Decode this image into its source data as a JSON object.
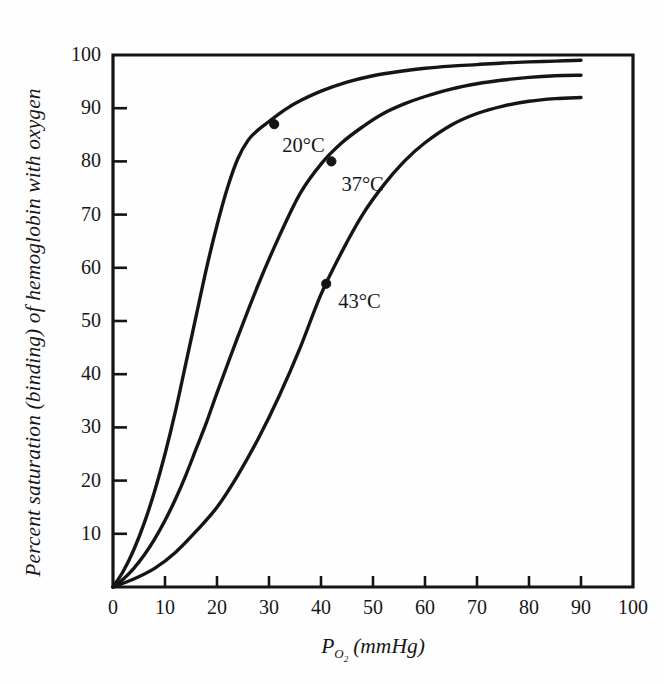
{
  "chart_data": {
    "type": "line",
    "title": "",
    "xlabel": "P_O2 (mmHg)",
    "xlabel_main": "P",
    "xlabel_sub": "O",
    "xlabel_sub2": "2",
    "xlabel_unit": "(mmHg)",
    "ylabel": "Percent saturation (binding) of hemoglobin with oxygen",
    "xlim": [
      0,
      100
    ],
    "ylim": [
      0,
      100
    ],
    "xticks": [
      0,
      10,
      20,
      30,
      40,
      50,
      60,
      70,
      80,
      90,
      100
    ],
    "yticks": [
      10,
      20,
      30,
      40,
      50,
      60,
      70,
      80,
      90,
      100
    ],
    "xtick_labels": [
      "0",
      "10",
      "20",
      "30",
      "40",
      "50",
      "60",
      "70",
      "80",
      "90",
      "100"
    ],
    "ytick_labels": [
      "10",
      "20",
      "30",
      "40",
      "50",
      "60",
      "70",
      "80",
      "90",
      "100"
    ],
    "grid": false,
    "legend_position": "inline-annotations",
    "line_color": "#151515",
    "background_color": "#fefefe",
    "axis_color": "#151515",
    "series": [
      {
        "name": "20°C",
        "label": "20°C",
        "marker_point": {
          "x": 31,
          "y": 87
        },
        "x": [
          0,
          2,
          4,
          6,
          8,
          10,
          12,
          14,
          16,
          18,
          20,
          22,
          24,
          26,
          28,
          30,
          32,
          34,
          36,
          40,
          45,
          50,
          55,
          60,
          65,
          70,
          75,
          80,
          85,
          90
        ],
        "y": [
          0,
          3,
          7,
          12,
          18,
          25,
          33,
          42,
          51,
          60,
          68,
          75,
          80.5,
          84,
          86,
          87.5,
          89,
          90.3,
          91.4,
          93.2,
          94.9,
          96.1,
          96.9,
          97.5,
          97.9,
          98.2,
          98.5,
          98.7,
          98.85,
          99
        ]
      },
      {
        "name": "37°C",
        "label": "37°C",
        "marker_point": {
          "x": 42,
          "y": 80
        },
        "x": [
          0,
          2,
          4,
          6,
          8,
          10,
          12,
          14,
          16,
          18,
          20,
          24,
          28,
          32,
          36,
          40,
          44,
          48,
          52,
          56,
          60,
          65,
          70,
          75,
          80,
          85,
          90
        ],
        "y": [
          0,
          1.5,
          3.5,
          6,
          9,
          12.5,
          16.5,
          21,
          26,
          31,
          36.5,
          47,
          57,
          66,
          74,
          79.5,
          83.5,
          86.5,
          89,
          90.8,
          92.2,
          93.6,
          94.6,
          95.3,
          95.8,
          96.1,
          96.2
        ]
      },
      {
        "name": "43°C",
        "label": "43°C",
        "marker_point": {
          "x": 41,
          "y": 57
        },
        "x": [
          0,
          4,
          8,
          12,
          16,
          20,
          24,
          28,
          32,
          36,
          40,
          44,
          48,
          52,
          56,
          60,
          65,
          70,
          75,
          80,
          85,
          90
        ],
        "y": [
          0,
          1.5,
          3.5,
          6.5,
          10.5,
          15,
          21,
          28,
          36,
          45,
          55,
          63,
          70,
          75.5,
          80,
          83.5,
          86.8,
          89,
          90.4,
          91.3,
          91.8,
          92
        ]
      }
    ]
  },
  "axis": {
    "y_title": "Percent saturation (binding) of hemoglobin with oxygen",
    "x_title_main": "P",
    "x_title_sub": "O",
    "x_title_sub_num": "2",
    "x_title_unit": "(mmHg)"
  }
}
